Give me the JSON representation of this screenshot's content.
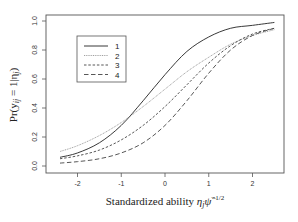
{
  "chart_data": {
    "type": "line",
    "title": "",
    "xlabel": "Standardized ability η_j ψ̂^(-1/2)",
    "ylabel": "Pr(y_ij = 1 | η_j)",
    "xlim": [
      -2.5,
      2.6
    ],
    "ylim": [
      0.0,
      1.0
    ],
    "x_ticks": [
      -2,
      -1,
      0,
      1,
      2
    ],
    "x_tick_labels": [
      "-2",
      "-1",
      "0",
      "1",
      "2"
    ],
    "y_ticks": [
      0.0,
      0.2,
      0.4,
      0.6,
      0.8,
      1.0
    ],
    "y_tick_labels": [
      "0.0",
      "0.2",
      "0.4",
      "0.6",
      "0.8",
      "1.0"
    ],
    "grid": false,
    "legend_position": "upper left",
    "x": [
      -2.4,
      -2.0,
      -1.5,
      -1.0,
      -0.5,
      0.0,
      0.5,
      1.0,
      1.5,
      2.0,
      2.5
    ],
    "series": [
      {
        "name": "1",
        "style": "solid",
        "values": [
          0.06,
          0.09,
          0.16,
          0.28,
          0.45,
          0.63,
          0.79,
          0.89,
          0.95,
          0.97,
          0.99
        ]
      },
      {
        "name": "2",
        "style": "dotted",
        "values": [
          0.1,
          0.14,
          0.21,
          0.3,
          0.41,
          0.53,
          0.65,
          0.75,
          0.84,
          0.9,
          0.94
        ]
      },
      {
        "name": "3",
        "style": "short-dash",
        "values": [
          0.05,
          0.07,
          0.11,
          0.18,
          0.28,
          0.41,
          0.56,
          0.71,
          0.83,
          0.91,
          0.95
        ]
      },
      {
        "name": "4",
        "style": "long-dash",
        "values": [
          0.02,
          0.03,
          0.05,
          0.09,
          0.16,
          0.28,
          0.45,
          0.64,
          0.8,
          0.9,
          0.95
        ]
      }
    ]
  },
  "labels": {
    "xlabel_main": "Standardized ability ",
    "xlabel_eta": "η",
    "xlabel_sub": "j",
    "xlabel_psi": "ψ̂",
    "xlabel_sup": "−1/2",
    "ylabel_main": "Pr(y",
    "ylabel_sub": "ij",
    "ylabel_rest": " = 1|η",
    "ylabel_sub2": "j",
    "ylabel_close": ")"
  },
  "legend": {
    "items": [
      {
        "label": "1"
      },
      {
        "label": "2"
      },
      {
        "label": "3"
      },
      {
        "label": "4"
      }
    ]
  }
}
